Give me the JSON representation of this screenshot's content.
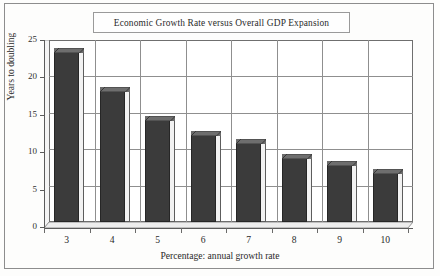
{
  "chart_data": {
    "type": "bar",
    "title": "Economic Growth Rate versus Overall GDP Expansion",
    "xlabel": "Percentage: annual growth rate",
    "ylabel": "Years to doubling",
    "categories": [
      "3",
      "4",
      "5",
      "6",
      "7",
      "8",
      "9",
      "10"
    ],
    "values": [
      23.3,
      18.0,
      14.0,
      12.0,
      10.8,
      8.8,
      7.8,
      6.8
    ],
    "ylim": [
      0,
      25
    ],
    "yticks": [
      "0",
      "5",
      "10",
      "15",
      "20",
      "25"
    ],
    "ytick_values": [
      0,
      5,
      10,
      15,
      20,
      25
    ],
    "grid": true,
    "legend": false,
    "bar_color": "#3b3b3b",
    "grid_color": "#8f8f8f",
    "axis_color": "#5b5b5b",
    "frame_color": "#8d8d8d",
    "background": "#fdfdfc"
  }
}
